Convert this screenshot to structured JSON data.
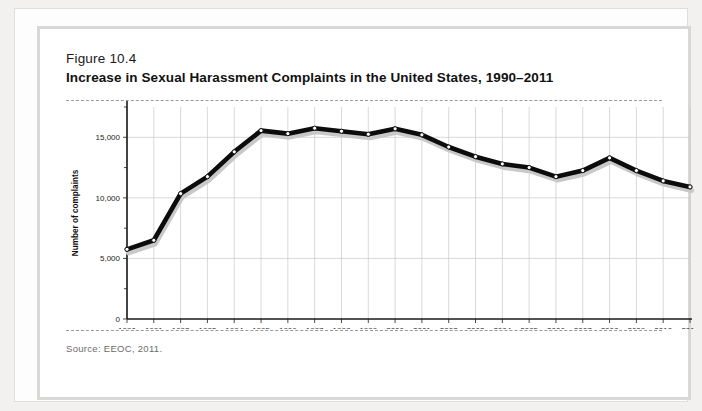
{
  "figure": {
    "number": "Figure 10.4",
    "title": "Increase in Sexual Harassment Complaints in the United States, 1990–2011",
    "source": "Source: EEOC, 2011."
  },
  "colors": {
    "line": "#0c0c0c",
    "line_shadow": "#c8c8c8",
    "marker_fill": "#ffffff",
    "grid": "#c9c9c9",
    "axis": "#1a1a1a",
    "frame": "#d9d8d6",
    "page_background": "#f2f1ef"
  },
  "chart_data": {
    "type": "line",
    "title": "Increase in Sexual Harassment Complaints in the United States, 1990–2011",
    "xlabel": "",
    "ylabel": "Number of complaints",
    "x": [
      1990,
      1991,
      1992,
      1993,
      1994,
      1995,
      1996,
      1997,
      1998,
      1999,
      2000,
      2001,
      2002,
      2003,
      2004,
      2005,
      2006,
      2007,
      2008,
      2009,
      2010,
      2011
    ],
    "categories": [
      "1990",
      "1991",
      "1992",
      "1993",
      "1994",
      "1995",
      "1996",
      "1997",
      "1998",
      "1999",
      "2000",
      "2001",
      "2002",
      "2003",
      "2004",
      "2005",
      "2006",
      "2007",
      "2008",
      "2009",
      "2010",
      "2011"
    ],
    "values": [
      5750,
      6500,
      10350,
      11750,
      13800,
      15550,
      15300,
      15750,
      15500,
      15250,
      15700,
      15200,
      14200,
      13400,
      12800,
      12500,
      11750,
      12250,
      13300,
      12250,
      11400,
      10900
    ],
    "series": [
      {
        "name": "Number of complaints",
        "values": [
          5750,
          6500,
          10350,
          11750,
          13800,
          15550,
          15300,
          15750,
          15500,
          15250,
          15700,
          15200,
          14200,
          13400,
          12800,
          12500,
          11750,
          12250,
          13300,
          12250,
          11400,
          10900
        ]
      }
    ],
    "ylim": [
      0,
      17500
    ],
    "yticks": [
      0,
      5000,
      10000,
      15000
    ],
    "ytick_labels": [
      "0",
      "5,000",
      "10,000",
      "15,000"
    ],
    "grid": true,
    "legend": false,
    "legend_position": "none"
  }
}
